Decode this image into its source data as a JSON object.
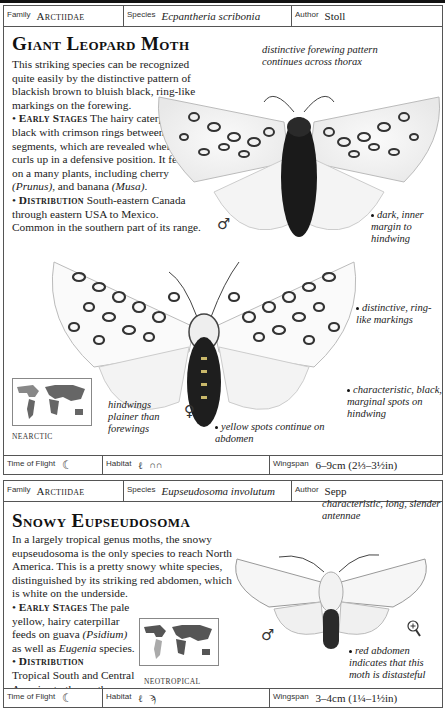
{
  "entry1": {
    "meta": {
      "family_label": "Family",
      "family_value": "Arctiidae",
      "species_label": "Species",
      "species_value": "Ecpantheria scribonia",
      "author_label": "Author",
      "author_value": "Stoll"
    },
    "title": "Giant Leopard Moth",
    "intro": "This striking species can be recognized quite easily by the distinctive pattern of blackish brown to bluish black, ring-like markings on the forewing.",
    "early_stages_heading": "Early Stages",
    "early_stages_text_1": "The hairy caterpillar is black with crimson rings between the segments, which are revealed when it curls up in a defensive position. It feeds on a many plants, including cherry",
    "early_stages_latin_1": "(Prunus)",
    "early_stages_text_2": ", and banana",
    "early_stages_latin_2": "(Musa)",
    "early_stages_text_3": ".",
    "distribution_heading": "Distribution",
    "distribution_text": "South-eastern Canada through eastern USA to Mexico. Common in the southern part of its range.",
    "annotations": {
      "thorax": "distinctive forewing pattern continues across thorax",
      "inner_margin": "dark, inner margin to hindwing",
      "ring_markings": "distinctive, ring-like markings",
      "marginal_spots": "characteristic, black, marginal spots on hindwing",
      "hindwings": "hindwings plainer than forewings",
      "yellow_spots": "yellow spots continue on abdomen"
    },
    "male_symbol": "♂",
    "female_symbol": "♀",
    "map_label": "NEARCTIC",
    "footer": {
      "time_label": "Time of Flight",
      "time_icon": "moon-icon",
      "habitat_label": "Habitat",
      "habitat_icons": [
        "grass-icon",
        "hedge-icon"
      ],
      "wingspan_label": "Wingspan",
      "wingspan_value": "6–9cm (2⅓–3½in)"
    }
  },
  "entry2": {
    "meta": {
      "family_label": "Family",
      "family_value": "Arctiidae",
      "species_label": "Species",
      "species_value": "Eupseudosoma involutum",
      "author_label": "Author",
      "author_value": "Sepp"
    },
    "title": "Snowy Eupseudosoma",
    "intro": "In a largely tropical genus moths, the snowy eupseudosoma is the only species to reach North America. This is a pretty snowy white species, distinguished by its striking red abdomen, which is white on the underside.",
    "early_stages_heading": "Early Stages",
    "early_stages_text_1": "The pale yellow, hairy caterpillar feeds on guava",
    "early_stages_latin_1": "(Psidium)",
    "early_stages_text_2": "as well as",
    "early_stages_latin_2": "Eugenia",
    "early_stages_text_3": "species.",
    "distribution_heading": "Distribution",
    "distribution_text": "Tropical South and Central America to the southern USA.",
    "annotations": {
      "antennae": "characteristic, long, slender antennae",
      "red_abdomen": "red abdomen indicates that this moth is distasteful"
    },
    "male_symbol": "♂",
    "map_label": "NEOTROPICAL",
    "footer": {
      "time_label": "Time of Flight",
      "time_icon": "moon-icon",
      "habitat_label": "Habitat",
      "habitat_icons": [
        "grass-icon",
        "palm-tree-icon"
      ],
      "wingspan_label": "Wingspan",
      "wingspan_value": "3–4cm (1¼–1½in)"
    }
  }
}
